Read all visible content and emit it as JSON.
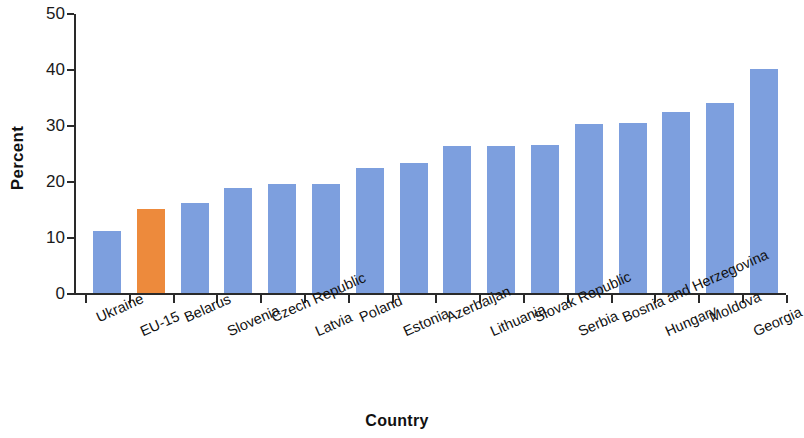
{
  "chart_data": {
    "type": "bar",
    "title": "",
    "xlabel": "Country",
    "ylabel": "Percent",
    "ylim": [
      0,
      50
    ],
    "yticks": [
      0,
      10,
      20,
      30,
      40,
      50
    ],
    "grid": false,
    "legend": "none",
    "highlight_category": "EU-15",
    "colors": {
      "bar": "#7d9fde",
      "highlight": "#ed8a3c",
      "axis": "#2a2a2a",
      "text": "#111111",
      "background": "#ffffff"
    },
    "categories": [
      "Ukraine",
      "EU-15",
      "Belarus",
      "Slovenia",
      "Czech Republic",
      "Latvia",
      "Poland",
      "Estonia",
      "Azerbaijan",
      "Lithuania",
      "Slovak Republic",
      "Serbia",
      "Bosnia and Herzegovina",
      "Hungary",
      "Moldova",
      "Georgia"
    ],
    "values": [
      11.1,
      15.0,
      16.0,
      18.8,
      19.4,
      19.4,
      22.3,
      23.3,
      26.2,
      26.2,
      26.5,
      30.2,
      30.4,
      32.4,
      34.0,
      40.0
    ]
  }
}
